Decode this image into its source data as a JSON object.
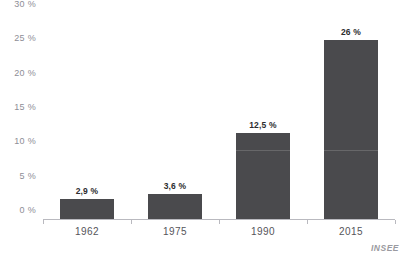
{
  "source_note": "INSEE",
  "clipped_title": "",
  "chart_data": {
    "type": "bar",
    "title": "",
    "subtitle": "",
    "xlabel": "",
    "ylabel": "",
    "categories": [
      "1962",
      "1975",
      "1990",
      "2015"
    ],
    "values": [
      2.9,
      3.6,
      12.5,
      26
    ],
    "value_labels": [
      "2,9 %",
      "3,6 %",
      "12,5 %",
      "26 %"
    ],
    "ylim": [
      0,
      30
    ],
    "ytick_values": [
      0,
      5,
      10,
      15,
      20,
      25,
      30
    ],
    "ytick_labels": [
      "0 %",
      "5 %",
      "10 %",
      "15 %",
      "20 %",
      "25 %",
      "30 %"
    ],
    "grid": false,
    "legend": "none",
    "bar_color": "#4a4a4d",
    "axis_color": "#b9b9bf",
    "tick_label_color": "#8e8e96",
    "value_label_color": "#2c2c2e",
    "source": "INSEE",
    "decimal_separator": ","
  }
}
